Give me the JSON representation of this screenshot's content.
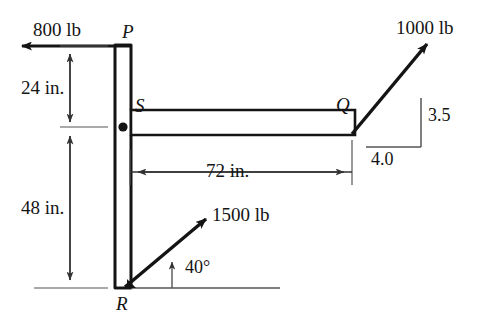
{
  "figure": {
    "kind": "statics-free-body-diagram",
    "background_color": "#ffffff",
    "ink_color": "#141414",
    "thin_line_color": "#555555",
    "members": {
      "vertical_member_label": "vertical column P-R",
      "horizontal_member_label": "horizontal arm S-Q"
    },
    "points": [
      {
        "id": "P",
        "label": "P",
        "x": 123,
        "y": 45,
        "role": "top-of-column"
      },
      {
        "id": "S",
        "label": "S",
        "x": 131,
        "y": 112,
        "role": "arm-attachment"
      },
      {
        "id": "Q",
        "label": "Q",
        "x": 352,
        "y": 112,
        "role": "arm-tip"
      },
      {
        "id": "R",
        "label": "R",
        "x": 123,
        "y": 288,
        "role": "base-of-column"
      }
    ],
    "pin_label": "pin-support",
    "forces": [
      {
        "id": "force-800",
        "label": "800 lb",
        "magnitude": 800,
        "unit": "lb",
        "direction": "horizontal-left",
        "applied_at": "P"
      },
      {
        "id": "force-1000",
        "label": "1000 lb",
        "magnitude": 1000,
        "unit": "lb",
        "direction": "up-and-right along 3.5:4.0 slope",
        "applied_at": "Q",
        "slope_rise_label": "3.5",
        "slope_run_label": "4.0",
        "slope_rise": 3.5,
        "slope_run": 4.0
      },
      {
        "id": "force-1500",
        "label": "1500 lb",
        "magnitude": 1500,
        "unit": "lb",
        "direction": "up-and-right at 40 degrees",
        "applied_at": "R",
        "angle_label": "40°",
        "angle_degrees": 40
      }
    ],
    "dimensions": [
      {
        "id": "dim-24",
        "label": "24 in.",
        "value": 24,
        "unit": "in.",
        "orientation": "vertical",
        "spans": "P to S level"
      },
      {
        "id": "dim-48",
        "label": "48 in.",
        "value": 48,
        "unit": "in.",
        "orientation": "vertical",
        "spans": "S level to R"
      },
      {
        "id": "dim-72",
        "label": "72 in.",
        "value": 72,
        "unit": "in.",
        "orientation": "horizontal",
        "spans": "column centerline to Q"
      }
    ]
  }
}
